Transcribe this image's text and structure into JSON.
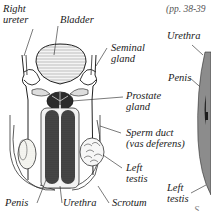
{
  "diagram": {
    "type": "anatomical-illustration",
    "labels": {
      "right_ureter": [
        "Right",
        "ureter"
      ],
      "bladder": "Bladder",
      "seminal_gland": [
        "Seminal",
        "gland"
      ],
      "prostate_gland": [
        "Prostate",
        "gland"
      ],
      "sperm_duct": [
        "Sperm duct",
        "(vas deferens)"
      ],
      "left_testis": [
        "Left",
        "testis"
      ],
      "penis": "Penis",
      "urethra": "Urethra",
      "scrotum": "Scrotum"
    },
    "side_panel": {
      "page_ref": "(pp. 38-39",
      "urethra": "Urethra",
      "penis": "Penis",
      "left_testis": [
        "Left",
        "testis"
      ],
      "partial_bottom": "S"
    }
  }
}
